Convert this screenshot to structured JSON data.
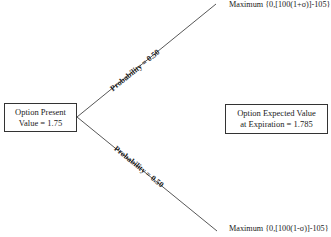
{
  "present_box": {
    "line1": "Option Present",
    "line2": "Value = 1.75"
  },
  "expected_box": {
    "line1": "Option Expected Value",
    "line2": "at Expiration = 1.785"
  },
  "up_branch": {
    "probability_label": "Probability = 0.50",
    "outcome": "Maximum {0,[100(1+σ)]-105}"
  },
  "down_branch": {
    "probability_label": "Probability = 0.50",
    "outcome": "Maximum {0,[100(1-σ)]-105}"
  },
  "colors": {
    "line": "#444444",
    "text": "#1a1a1a",
    "box_border": "#333333"
  }
}
